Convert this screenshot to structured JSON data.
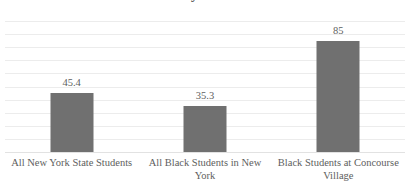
{
  "chart_data": {
    "type": "bar",
    "title": "Math Proficiency Rates in 2023-2024",
    "title_note": "title is cropped at the top edge of the screenshot",
    "categories": [
      "All New York State Students",
      "All Black Students in New York",
      "Black Students at Concourse Village"
    ],
    "values": [
      45.4,
      35.3,
      85
    ],
    "value_labels": [
      "45.4",
      "35.3",
      "85"
    ],
    "xlabel": "",
    "ylabel": "",
    "ylim": [
      0,
      100
    ],
    "y_tick_labels": [],
    "gridlines": 10,
    "grid": true,
    "legend": false,
    "legend_position": "none",
    "series": [
      {
        "name": "Proficiency",
        "values": [
          45.4,
          35.3,
          85
        ],
        "color": "#707070"
      }
    ],
    "colors": {
      "bar": "#707070",
      "gridline": "#ececec",
      "axis": "#e2e2e2",
      "text": "#5e5e5e",
      "background": "#ffffff"
    }
  }
}
